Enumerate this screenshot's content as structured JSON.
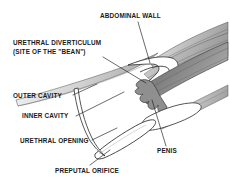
{
  "figure": {
    "background_color": "#ffffff",
    "line_color": "#1a1a1a",
    "text_color": "#1a1a1a",
    "shade_light": "#e3e3e3",
    "shade_mid": "#b9b9b9",
    "shade_dark": "#8a8a8a",
    "shade_darkest": "#6e6e6e"
  },
  "labels": {
    "abdominal_wall": "ABDOMINAL WALL",
    "urethral_diverticulum_line1": "URETHRAL DIVERTICULUM",
    "urethral_diverticulum_line2": "(SITE OF THE \"BEAN\")",
    "outer_cavity": "OUTER CAVITY",
    "inner_cavity": "INNER CAVITY",
    "urethral_opening": "URETHRAL OPENING",
    "preputal_orifice": "PREPUTAL ORIFICE",
    "penis": "PENIS"
  }
}
